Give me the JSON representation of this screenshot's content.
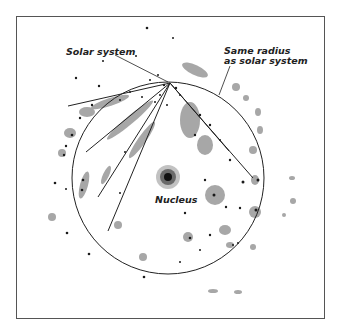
{
  "diagram": {
    "title": "",
    "labels": {
      "solar_system": "Solar system",
      "same_radius": "Same radius\nas solar system",
      "nucleus": "Nucleus"
    },
    "colors": {
      "ink": "#222222",
      "star_cloud": "#7a7a7a",
      "frame": "#555555",
      "background": "#ffffff"
    },
    "solar_system_position": [
      170,
      83
    ],
    "nucleus_position": [
      168,
      177
    ],
    "circle_radius": 95,
    "sight_lines_endpoints": [
      [
        68,
        106
      ],
      [
        86,
        152
      ],
      [
        98,
        197
      ],
      [
        108,
        231
      ],
      [
        229,
        151
      ],
      [
        253,
        178
      ]
    ]
  }
}
